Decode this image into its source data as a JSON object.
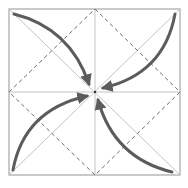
{
  "diagram": {
    "type": "origami-fold-diagram",
    "colors": {
      "background": "#ffffff",
      "frame": "#a6a6a6",
      "crease": "#c4c4c4",
      "dashed_valley": "#6e6e6e",
      "arrow": "#5c5c5c"
    },
    "square": {
      "x1": 9,
      "y1": 9,
      "x2": 180,
      "y2": 175
    },
    "center": {
      "x": 95,
      "y": 92
    },
    "arrows": [
      {
        "from": "top-left-corner",
        "to": "center"
      },
      {
        "from": "top-right-corner",
        "to": "center"
      },
      {
        "from": "bottom-left-corner",
        "to": "center"
      },
      {
        "from": "bottom-right-corner",
        "to": "center"
      }
    ]
  }
}
